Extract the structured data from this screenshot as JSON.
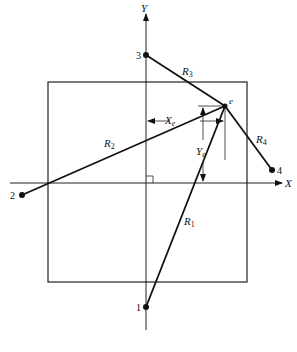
{
  "axes": {
    "x_label": "X",
    "y_label": "Y"
  },
  "origin": {
    "x": 146,
    "y": 183
  },
  "square": {
    "left": 48,
    "top": 82,
    "right": 247,
    "bottom": 282
  },
  "points": [
    {
      "id": "1",
      "label": "1",
      "x": 146,
      "y": 307
    },
    {
      "id": "2",
      "label": "2",
      "x": 22,
      "y": 195
    },
    {
      "id": "3",
      "label": "3",
      "x": 146,
      "y": 55
    },
    {
      "id": "4",
      "label": "4",
      "x": 272,
      "y": 170
    },
    {
      "id": "e",
      "label": "e",
      "x": 225,
      "y": 106
    }
  ],
  "ranges": [
    {
      "label": "R",
      "sub": "1",
      "from": "1"
    },
    {
      "label": "R",
      "sub": "2",
      "from": "2"
    },
    {
      "label": "R",
      "sub": "3",
      "from": "3"
    },
    {
      "label": "R",
      "sub": "4",
      "from": "4"
    }
  ],
  "dimensions": {
    "xe_label": "X",
    "xe_sub": "e",
    "ye_label": "Y",
    "ye_sub": "e"
  }
}
